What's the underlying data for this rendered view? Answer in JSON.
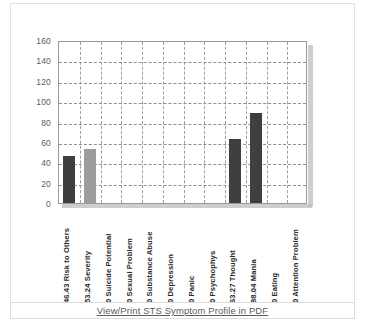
{
  "panel": {
    "footer": {
      "link_label": "View/Print STS Symptom Profile in PDF"
    }
  },
  "chart_data": {
    "type": "bar",
    "title": "",
    "xlabel": "",
    "ylabel": "",
    "ylim": [
      0,
      160
    ],
    "yticks": [
      160,
      140,
      120,
      100,
      80,
      60,
      40,
      20,
      0
    ],
    "grid": true,
    "legend": "none",
    "categories": [
      "46.43 Risk to Others",
      "53.24 Severity",
      "0 Suicide Potential",
      "0 Sexual Problem",
      "0 Substance Abuse",
      "0 Depression",
      "0 Panic",
      "0 Psychophys",
      "63.27 Thought",
      "88.04 Mania",
      "0 Eating",
      "0 Attention Problem"
    ],
    "values": [
      46.43,
      53.24,
      0,
      0,
      0,
      0,
      0,
      0,
      63.27,
      88.04,
      0,
      0
    ],
    "bar_colors": [
      "#3f3f3f",
      "#9c9c9c",
      "#3f3f3f",
      "#9c9c9c",
      "#3f3f3f",
      "#9c9c9c",
      "#3f3f3f",
      "#9c9c9c",
      "#3f3f3f",
      "#3f3f3f",
      "#3f3f3f",
      "#9c9c9c"
    ]
  }
}
